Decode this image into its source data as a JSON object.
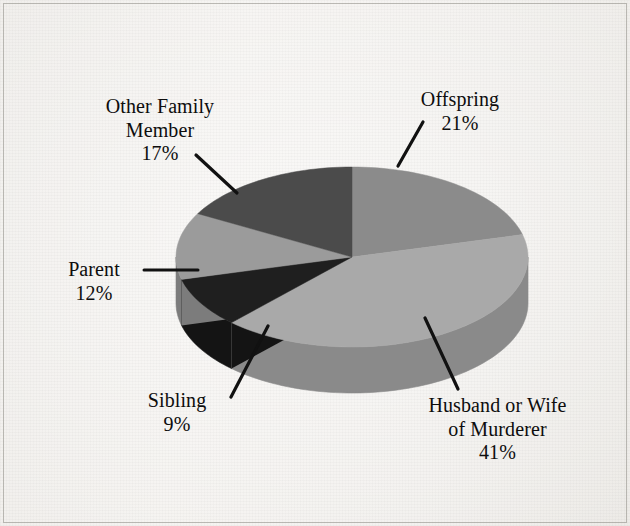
{
  "figure": {
    "background_color": "#f3f1ed",
    "text_color": "#0d0d0d",
    "leader_line_color": "#111111"
  },
  "chart_data": {
    "type": "pie",
    "title": "",
    "subtitle": "",
    "xlabel": "",
    "ylabel": "",
    "three_d": true,
    "legend": "none",
    "grid": false,
    "labels_show_percent": true,
    "categories": [
      "Offspring",
      "Husband or Wife of Murderer",
      "Sibling",
      "Parent",
      "Other Family Member"
    ],
    "values": [
      21,
      41,
      9,
      12,
      17
    ],
    "units": "percent",
    "total": 100,
    "slices": [
      {
        "label": "Offspring",
        "label_line1": "Offspring",
        "label_line2": "",
        "value": 21,
        "percent_text": "21%",
        "color": "#8b8b8b",
        "side_color": "#6f6f6f",
        "start_angle_deg": 0,
        "end_angle_deg": 75.6
      },
      {
        "label": "Husband or Wife of Murderer",
        "label_line1": "Husband or Wife",
        "label_line2": "of Murderer",
        "value": 41,
        "percent_text": "41%",
        "color": "#a9a9a9",
        "side_color": "#8a8a8a",
        "start_angle_deg": 75.6,
        "end_angle_deg": 223.2
      },
      {
        "label": "Sibling",
        "label_line1": "Sibling",
        "label_line2": "",
        "value": 9,
        "percent_text": "9%",
        "color": "#1f1f1f",
        "side_color": "#141414",
        "start_angle_deg": 223.2,
        "end_angle_deg": 255.6
      },
      {
        "label": "Parent",
        "label_line1": "Parent",
        "label_line2": "",
        "value": 12,
        "percent_text": "12%",
        "color": "#9b9b9b",
        "side_color": "#7c7c7c",
        "start_angle_deg": 255.6,
        "end_angle_deg": 298.8
      },
      {
        "label": "Other Family Member",
        "label_line1": "Other Family",
        "label_line2": "Member",
        "value": 17,
        "percent_text": "17%",
        "color": "#4b4b4b",
        "side_color": "#3b3b3b",
        "start_angle_deg": 298.8,
        "end_angle_deg": 360
      }
    ]
  },
  "labels": {
    "offspring": {
      "name": "Offspring",
      "percent": "21%"
    },
    "husband_or_wife": {
      "line1": "Husband or Wife",
      "line2": "of Murderer",
      "percent": "41%"
    },
    "sibling": {
      "name": "Sibling",
      "percent": "9%"
    },
    "parent": {
      "name": "Parent",
      "percent": "12%"
    },
    "other_family_member": {
      "line1": "Other Family",
      "line2": "Member",
      "percent": "17%"
    }
  }
}
